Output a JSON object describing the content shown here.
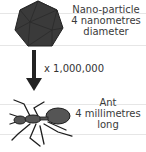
{
  "nanoparticle": {
    "name": "Nano-particle",
    "size": "4 nanometres",
    "measure": "diameter"
  },
  "scale": {
    "factor": "x 1,000,000"
  },
  "ant": {
    "name": "Ant",
    "size": "4 millimetres",
    "measure": "long"
  },
  "colors": {
    "shape_fill": "#3a3a3a",
    "ant_fill": "#555555",
    "arrow": "#222222",
    "rule": "#e6e6e6"
  }
}
